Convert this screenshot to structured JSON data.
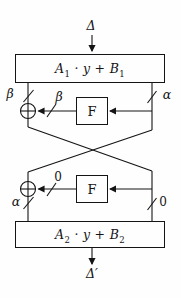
{
  "diagram": {
    "input_label": "Δ",
    "output_label": "Δ′",
    "box1": {
      "base1": "A",
      "sub1": "1",
      "middle": " · y + ",
      "base2": "B",
      "sub2": "1"
    },
    "box2": {
      "base1": "A",
      "sub1": "2",
      "middle": " · y + ",
      "base2": "B",
      "sub2": "2"
    },
    "f_box_1": "F",
    "f_box_2": "F",
    "wire_labels": {
      "stage1_left": "β",
      "stage1_f_output": "β",
      "stage1_right": "α",
      "stage2_f_output": "0",
      "stage2_left": "α",
      "stage2_right": "0"
    }
  }
}
